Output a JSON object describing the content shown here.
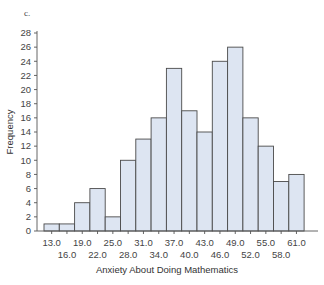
{
  "panel_label": "c.",
  "chart_data": {
    "type": "bar",
    "subtype": "histogram",
    "title": "",
    "xlabel": "Anxiety About Doing Mathematics",
    "ylabel": "Frequency",
    "categories": [
      "13.0",
      "16.0",
      "19.0",
      "22.0",
      "25.0",
      "28.0",
      "31.0",
      "34.0",
      "37.0",
      "40.0",
      "43.0",
      "46.0",
      "49.0",
      "52.0",
      "55.0",
      "58.0",
      "61.0"
    ],
    "values": [
      1,
      1,
      4,
      6,
      2,
      10,
      13,
      16,
      23,
      17,
      14,
      24,
      26,
      16,
      12,
      7,
      8
    ],
    "yticks": [
      0,
      2,
      4,
      6,
      8,
      10,
      12,
      14,
      16,
      18,
      20,
      22,
      24,
      26,
      28
    ],
    "ylim": [
      0,
      28
    ],
    "x_tick_labels_row1": [
      "13.0",
      "19.0",
      "25.0",
      "31.0",
      "37.0",
      "43.0",
      "49.0",
      "55.0",
      "61.0"
    ],
    "x_tick_labels_row2": [
      "16.0",
      "22.0",
      "28.0",
      "34.0",
      "40.0",
      "46.0",
      "52.0",
      "58.0"
    ],
    "grid": false,
    "legend": null,
    "colors": {
      "bar_fill": "#dde5f2",
      "bar_stroke": "#4a4a4a",
      "axis": "#555555"
    }
  }
}
